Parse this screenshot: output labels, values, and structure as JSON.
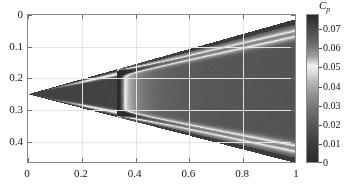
{
  "figure": {
    "type": "contour-field-plot",
    "background": "#ffffff"
  },
  "axes": {
    "x": {
      "min": 0,
      "max": 1,
      "ticks": [
        0,
        0.2,
        0.4,
        0.6,
        0.8,
        1
      ],
      "tick_labels": [
        "0",
        "0.2",
        "0.4",
        "0.6",
        "0.8",
        "1"
      ],
      "label": ""
    },
    "y": {
      "min": 0,
      "max": 0.47,
      "inverted": true,
      "ticks": [
        0,
        0.1,
        0.2,
        0.3,
        0.4
      ],
      "tick_labels": [
        "0",
        "0.1",
        "0.2",
        "0.3",
        "0.4"
      ],
      "label": ""
    },
    "grid": true,
    "frame_color": "#8a8a8a",
    "grid_color": "#e3e3e3"
  },
  "colorbar": {
    "title": "C",
    "title_sub": "p",
    "min": 0,
    "max": 0.078,
    "ticks": [
      0,
      0.01,
      0.02,
      0.03,
      0.04,
      0.05,
      0.06,
      0.07
    ],
    "tick_labels": [
      "0",
      "0.01",
      "0.02",
      "0.03",
      "0.04",
      "0.05",
      "0.06",
      "0.07"
    ],
    "orientation": "vertical",
    "position": "right",
    "colormap": "gray-bone",
    "stops": [
      {
        "value": 0.078,
        "color": "#2b2b2b"
      },
      {
        "value": 0.07,
        "color": "#4a4a4a"
      },
      {
        "value": 0.062,
        "color": "#6e6e6e"
      },
      {
        "value": 0.056,
        "color": "#9e9e9e"
      },
      {
        "value": 0.051,
        "color": "#f2f2f2"
      },
      {
        "value": 0.047,
        "color": "#d8d8d8"
      },
      {
        "value": 0.042,
        "color": "#b4b4b4"
      },
      {
        "value": 0.035,
        "color": "#8e8e8e"
      },
      {
        "value": 0.026,
        "color": "#6a6a6a"
      },
      {
        "value": 0.016,
        "color": "#4c4c4c"
      },
      {
        "value": 0.008,
        "color": "#383838"
      },
      {
        "value": 0.0,
        "color": "#2a2a2a"
      }
    ]
  },
  "chart_data": {
    "type": "heatmap",
    "title": "",
    "xlabel": "",
    "ylabel": "",
    "xlim": [
      0,
      1
    ],
    "ylim": [
      0.47,
      0
    ],
    "colorbar_label": "Cp",
    "colorbar_range": [
      0,
      0.078
    ],
    "grid": true,
    "geometry": {
      "apex": {
        "x": 0.0,
        "y": 0.25
      },
      "upper_trailing": {
        "x": 1.0,
        "y": 0.012
      },
      "lower_trailing": {
        "x": 1.0,
        "y": 0.468
      },
      "transition_x": 0.332
    },
    "features": [
      {
        "name": "upstream-wedge-region",
        "x_range": [
          0.0,
          0.332
        ],
        "value": 0.012,
        "color": "#333333"
      },
      {
        "name": "transition-bright-band",
        "x_range": [
          0.332,
          0.352
        ],
        "value": 0.05,
        "color": "#e8e8e8"
      },
      {
        "name": "post-transition-region",
        "x_range": [
          0.352,
          0.4
        ],
        "value": 0.04,
        "color": "#a8a8a8"
      },
      {
        "name": "downstream-core-region",
        "x_range": [
          0.4,
          1.0
        ],
        "value": 0.02,
        "color": "#4e4e4e"
      },
      {
        "name": "upper-shear-streak",
        "value": 0.052,
        "color": "#e0e0e0"
      },
      {
        "name": "lower-shear-streak",
        "value": 0.052,
        "color": "#e0e0e0"
      }
    ],
    "x_samples": [
      0.0,
      0.1,
      0.2,
      0.3,
      0.332,
      0.35,
      0.4,
      0.5,
      0.6,
      0.7,
      0.8,
      0.9,
      1.0
    ],
    "centerline_values": [
      0.012,
      0.012,
      0.012,
      0.012,
      0.05,
      0.041,
      0.03,
      0.022,
      0.02,
      0.019,
      0.018,
      0.018,
      0.017
    ]
  }
}
